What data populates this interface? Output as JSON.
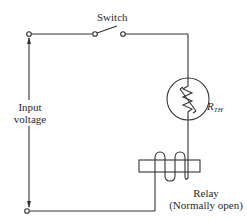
{
  "diagram": {
    "type": "circuit-schematic",
    "labels": {
      "switch": "Switch",
      "input_voltage_line1": "Input",
      "input_voltage_line2": "voltage",
      "thermistor_main": "R",
      "thermistor_sub": "TH",
      "relay_line1": "Relay",
      "relay_line2": "(Normally open)"
    },
    "components": [
      {
        "id": "input-terminal-top",
        "kind": "terminal"
      },
      {
        "id": "input-terminal-bottom",
        "kind": "terminal"
      },
      {
        "id": "switch",
        "kind": "spst-switch",
        "state": "open"
      },
      {
        "id": "thermistor",
        "kind": "thermistor",
        "label": "R_TH"
      },
      {
        "id": "relay",
        "kind": "relay-coil",
        "state": "Normally open"
      }
    ],
    "colors": {
      "line": "#333333",
      "background": "#ffffff"
    }
  }
}
